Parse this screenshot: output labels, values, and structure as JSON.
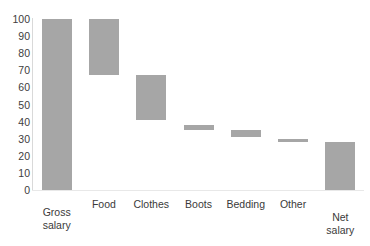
{
  "chart_data": {
    "type": "bar",
    "subtype": "waterfall",
    "title": "",
    "xlabel": "",
    "ylabel": "",
    "ylim": [
      0,
      100
    ],
    "ytick_step": 10,
    "yticks": [
      100,
      90,
      80,
      70,
      60,
      50,
      40,
      30,
      20,
      10,
      0
    ],
    "grid": false,
    "legend": null,
    "categories": [
      "Gross salary",
      "Food",
      "Clothes",
      "Boots",
      "Bedding",
      "Other",
      "Net salary"
    ],
    "bar_color": "#a6a6a6",
    "axis_color": "#d9d9d9",
    "bars": [
      {
        "label": "Gross salary",
        "base": 0,
        "top": 100,
        "value": 100,
        "kind": "total",
        "label_lines": "Gross\nsalary"
      },
      {
        "label": "Food",
        "base": 67,
        "top": 100,
        "value": -33,
        "kind": "decrease",
        "label_lines": "Food"
      },
      {
        "label": "Clothes",
        "base": 41,
        "top": 67,
        "value": -26,
        "kind": "decrease",
        "label_lines": "Clothes"
      },
      {
        "label": "Boots",
        "base": 35,
        "top": 38,
        "value": -3,
        "kind": "decrease",
        "label_lines": "Boots"
      },
      {
        "label": "Bedding",
        "base": 31,
        "top": 35,
        "value": -4,
        "kind": "decrease",
        "label_lines": "Bedding"
      },
      {
        "label": "Other",
        "base": 28,
        "top": 30,
        "value": -2,
        "kind": "decrease",
        "label_lines": "Other"
      },
      {
        "label": "Net salary",
        "base": 0,
        "top": 28,
        "value": 28,
        "kind": "total",
        "label_lines": "Net\nsalary"
      }
    ]
  }
}
